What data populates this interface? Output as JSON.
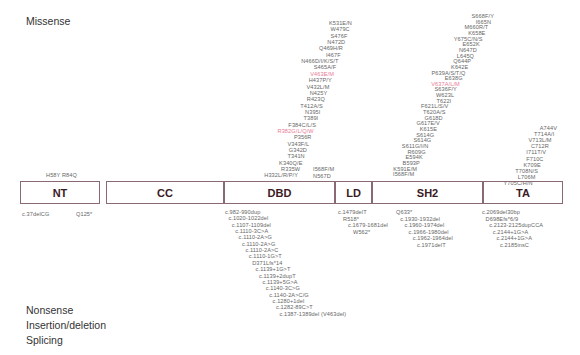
{
  "sections": {
    "missense": "Missense",
    "nonsense": "Nonsense",
    "indel": "Insertion/deletion",
    "splicing": "Splicing"
  },
  "domains": [
    {
      "name": "NT",
      "color": "#b88a96"
    },
    {
      "name": "CC",
      "color": "#f7a6b2"
    },
    {
      "name": "DBD",
      "color": "#f07a8c"
    },
    {
      "name": "LD",
      "color": "#f0405e"
    },
    {
      "name": "SH2",
      "color": "#d9c3c8"
    },
    {
      "name": "TA",
      "color": "#ebebeb"
    }
  ],
  "missense": {
    "nt": [
      "H58Y R84Q"
    ],
    "dbd": [
      "K531E/N",
      "W479C",
      "S476F",
      "N472D",
      "Q469H/R",
      "I467F",
      "N466D/I/K/S/T",
      "S465A/F",
      "V463E/M",
      "H437P/Y",
      "V432L/M",
      "N425Y",
      "R423Q",
      "T412A/S",
      "N395I",
      "T389I",
      "F384C/L/S",
      "R382G/L/Q/W",
      "P356R",
      "V343F/L",
      "G342D",
      "T341N",
      "K340Q/E",
      "R335W",
      "H332L/R/P/Y"
    ],
    "dbd_highlight": [
      "V463E/M",
      "R382G/L/Q/W"
    ],
    "ld": [
      "I568F/M",
      "N567D"
    ],
    "sh2": [
      "S668F/Y",
      "I665N",
      "M660R/T",
      "K658E",
      "Y675C/N/S",
      "E652K",
      "N647D",
      "L645Q",
      "Q644P",
      "K642E",
      "P639A/S/T/Q",
      "E638G",
      "V637A/L/M",
      "S636F/Y",
      "W623L",
      "T622I",
      "F621L/S/V",
      "T620A/S",
      "G618D",
      "G617E/V",
      "K615E",
      "S614G",
      "S614G",
      "S611G/I/N",
      "R609G",
      "E594K",
      "B593P",
      "K591E/M",
      "I568F/M"
    ],
    "sh2_highlight": [
      "V637A/L/M"
    ],
    "ta": [
      "A744V",
      "T714A/I",
      "V713L/M",
      "C712R",
      "I711T/V",
      "F710C",
      "K709E",
      "T708N/S",
      "L706M",
      "Y705C/H/N"
    ]
  },
  "mutations_below": {
    "nt": [
      "c.37delCG",
      "Q125*"
    ],
    "dbd": [
      "c.982-990dup",
      "c.1020-1022del",
      "c.1107-1109del",
      "c.1110-3C>A",
      "c.1110-2A>G",
      "c.1110-2A>G",
      "c.1110-2A>C",
      "c.1110-1G>T",
      "D371Lfs*14",
      "c.1139+1G>T",
      "c.1139+2dupT",
      "c.1139+5G>A",
      "c.1140-3C>G",
      "c.1140-2A>C/G",
      "c.1280+1del",
      "c.1282-89C>T",
      "c.1387-1389del (V463del)"
    ],
    "ld": [
      "c.1479delT",
      "R518*",
      "c.1679-1681del",
      "W562*"
    ],
    "sh2": [
      "Q633*",
      "c.1930-1932del",
      "c.1960-1974del",
      "c.1966-1980del",
      "c.1962-1964del",
      "c.1971delT"
    ],
    "ta": [
      "c.2069del30bp",
      "D698Efs*6/9",
      "c.2123-2125dupCCA",
      "c.2144+1G>A",
      "c.2144+1G>A",
      "c.2185insC"
    ]
  }
}
